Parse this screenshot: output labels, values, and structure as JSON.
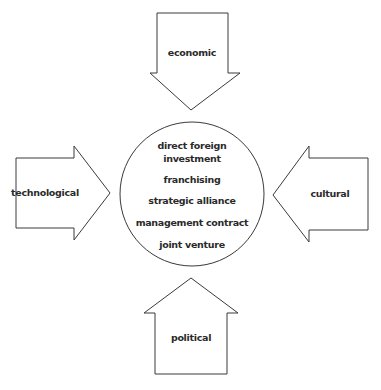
{
  "diagram": {
    "center": {
      "items": [
        "direct foreign",
        "investment",
        "franchising",
        "strategic alliance",
        "management contract",
        "joint venture"
      ]
    },
    "arrows": {
      "top": "economic",
      "left": "technological",
      "right": "cultural",
      "bottom": "political"
    }
  }
}
